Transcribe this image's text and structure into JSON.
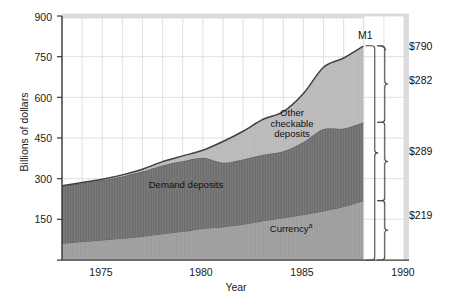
{
  "chart_data": {
    "type": "area",
    "stacked": true,
    "title": "",
    "xlabel": "Year",
    "ylabel": "Billions of dollars",
    "xlim": [
      1973,
      1990
    ],
    "ylim": [
      0,
      900
    ],
    "yticks": [
      150,
      300,
      450,
      600,
      750,
      900
    ],
    "xticks": [
      1975,
      1980,
      1985,
      1990
    ],
    "grid": true,
    "legend_position": "inline-annotations",
    "x": [
      1973,
      1974,
      1975,
      1976,
      1977,
      1978,
      1979,
      1980,
      1981,
      1982,
      1983,
      1984,
      1985,
      1986,
      1987,
      1988
    ],
    "series": [
      {
        "name": "Currency",
        "color": "#9d9d9d",
        "values": [
          62,
          68,
          74,
          80,
          88,
          97,
          106,
          116,
          123,
          132,
          145,
          156,
          168,
          181,
          197,
          219
        ]
      },
      {
        "name": "Demand deposits",
        "color": "#6f6f6f",
        "values": [
          210,
          215,
          220,
          228,
          238,
          252,
          258,
          261,
          236,
          239,
          243,
          245,
          267,
          302,
          288,
          289
        ]
      },
      {
        "name": "Other checkable deposits",
        "color": "#b9b9b9",
        "values": [
          2,
          3,
          4,
          6,
          9,
          14,
          20,
          28,
          78,
          104,
          131,
          146,
          179,
          228,
          260,
          282
        ]
      }
    ],
    "annotations": {
      "m1": "M1",
      "total": "$790",
      "other_checkable": "$282",
      "demand": "$289",
      "currency": "$219",
      "currency_label": "Currency",
      "currency_superscript": "a",
      "demand_label": "Demand deposits",
      "other_label_line1": "Other",
      "other_label_line2": "checkable",
      "other_label_line3": "deposits"
    }
  },
  "axis": {
    "y_title": "Billions of dollars",
    "x_title": "Year",
    "y_ticks": [
      "900",
      "750",
      "600",
      "450",
      "300",
      "150"
    ],
    "x_ticks": [
      "1975",
      "1980",
      "1985",
      "1990"
    ]
  },
  "colors": {
    "currency": "#9d9d9d",
    "demand_deposits": "#6f6f6f",
    "other_checkable": "#b9b9b9",
    "grid": "#d8d8d8",
    "axis": "#3a3a3a",
    "plot_background": "#ffffff",
    "text": "#1a1a1a"
  }
}
